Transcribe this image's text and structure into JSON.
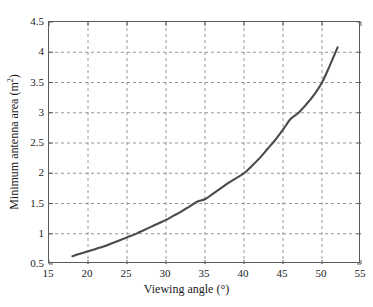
{
  "chart_data": {
    "type": "line",
    "title": "",
    "subtitle": "",
    "xlabel": "Viewing angle (°)",
    "ylabel_text": "Minimum antenna area (m",
    "ylabel_sup": "2",
    "ylabel_tail": ")",
    "ylabel_full": "Minimum antenna area (m²)",
    "xlim": [
      15,
      55
    ],
    "ylim": [
      0.5,
      4.5
    ],
    "xticks": [
      15,
      20,
      25,
      30,
      35,
      40,
      45,
      50,
      55
    ],
    "yticks": [
      0.5,
      1,
      1.5,
      2,
      2.5,
      3,
      3.5,
      4,
      4.5
    ],
    "xtick_labels": [
      "15",
      "20",
      "25",
      "30",
      "35",
      "40",
      "45",
      "50",
      "55"
    ],
    "ytick_labels": [
      "0.5",
      "1",
      "1.5",
      "2",
      "2.5",
      "3",
      "3.5",
      "4",
      "4.5"
    ],
    "grid": true,
    "grid_style": "dashed",
    "grid_color": "#8c8c8c",
    "legend": null,
    "series": [
      {
        "name": "Minimum antenna area",
        "color": "#4a4a4a",
        "line_width": 2.1,
        "x": [
          18.0,
          19.0,
          20.0,
          21.0,
          22.0,
          23.0,
          24.0,
          25.0,
          26.0,
          26.5,
          27.0,
          28.0,
          29.0,
          30.0,
          31.0,
          32.0,
          33.0,
          34.0,
          35.0,
          36.0,
          37.0,
          38.0,
          39.0,
          40.0,
          41.0,
          42.0,
          43.0,
          44.0,
          45.0,
          46.0,
          47.0,
          48.0,
          49.0,
          50.0,
          51.0,
          52.0
        ],
        "y": [
          0.63,
          0.67,
          0.71,
          0.75,
          0.79,
          0.84,
          0.89,
          0.94,
          0.99,
          1.02,
          1.05,
          1.11,
          1.17,
          1.23,
          1.3,
          1.37,
          1.45,
          1.53,
          1.57,
          1.66,
          1.75,
          1.84,
          1.92,
          2.0,
          2.12,
          2.25,
          2.4,
          2.55,
          2.72,
          2.9,
          3.0,
          3.14,
          3.3,
          3.5,
          3.78,
          4.08
        ]
      }
    ]
  },
  "axis": {
    "frame_color": "#5a5a5a"
  }
}
